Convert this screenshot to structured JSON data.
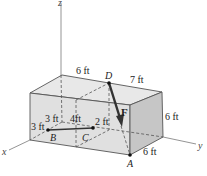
{
  "figure": {
    "type": "3D box force diagram",
    "axes": {
      "x": "x",
      "y": "y",
      "z": "z"
    },
    "points": {
      "A": "A",
      "B": "B",
      "C": "C",
      "D": "D"
    },
    "force_label": "F",
    "dimensions": {
      "top_left_edge": "6 ft",
      "top_right_edge": "7 ft",
      "right_height": "6 ft",
      "bottom_right_depth": "6 ft",
      "b_to_x_edge": "3 ft",
      "b_offset_back": "3 ft",
      "b_to_c": "4ft",
      "c_offset": "2 ft"
    },
    "colors": {
      "front_face": "#dcdcdc",
      "top_face": "#e6e6e6",
      "right_face": "#c4c4c4",
      "edge": "#555555",
      "force_arrow": "#333333",
      "axis": "#777777"
    }
  }
}
